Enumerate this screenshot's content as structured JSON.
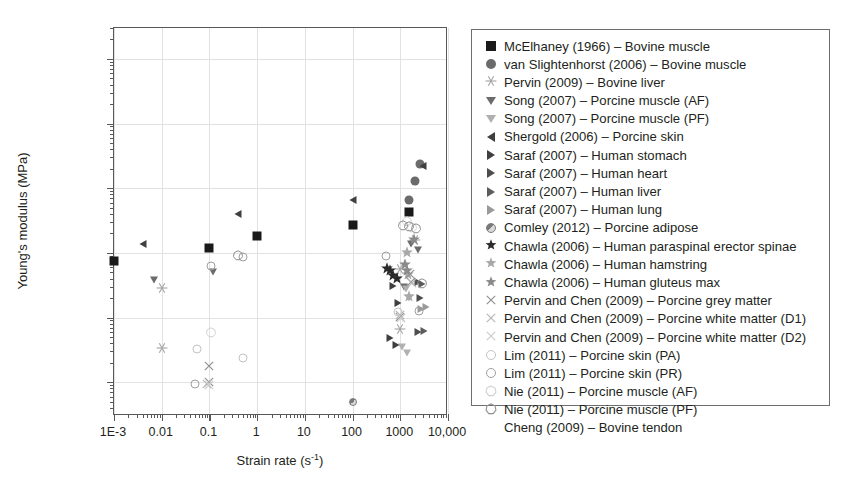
{
  "chart_data": {
    "type": "scatter",
    "title": "",
    "xlabel": "Strain rate (s-1)",
    "ylabel": "Young's modulus (MPa)",
    "xscale": "log",
    "yscale": "log",
    "xlim": [
      0.001,
      10000
    ],
    "ylim": [
      0.003,
      3000
    ],
    "grid": true,
    "legend_position": "right-outside",
    "xticklabels": [
      "1E-3",
      "0.01",
      "0.1",
      "1",
      "10",
      "100",
      "1000",
      "10,000"
    ],
    "xtickvalues": [
      0.001,
      0.01,
      0.1,
      1,
      10,
      100,
      1000,
      10000
    ],
    "yticklabels": [
      "0.01",
      "0.1",
      "1",
      "10",
      "100",
      "1000"
    ],
    "ytickvalues": [
      0.01,
      0.1,
      1,
      10,
      100,
      1000
    ],
    "series": [
      {
        "name": "McElhaney (1966) - Bovine muscle",
        "marker": "square-filled",
        "color": "#1a1a1a",
        "size": 9,
        "points": [
          [
            0.001,
            0.75
          ],
          [
            0.1,
            1.2
          ],
          [
            1,
            1.85
          ],
          [
            100,
            2.7
          ],
          [
            1500,
            4.3
          ]
        ]
      },
      {
        "name": "van Slightenhorst (2006) - Bovine muscle",
        "marker": "circle-filled",
        "color": "#6b6b6b",
        "size": 9,
        "points": [
          [
            1500,
            6.5
          ],
          [
            2000,
            13
          ],
          [
            2600,
            24
          ]
        ]
      },
      {
        "name": "Pervin (2009) - Bovine liver",
        "marker": "asterisk",
        "color": "#a6a6a6",
        "size": 10,
        "points": [
          [
            0.01,
            0.28
          ],
          [
            0.01,
            0.033
          ],
          [
            1000,
            0.55
          ],
          [
            1000,
            0.065
          ],
          [
            2000,
            1.5
          ]
        ]
      },
      {
        "name": "Song (2007) - Porcine muscle (AF)",
        "marker": "triangle-down",
        "color": "#6b6b6b",
        "size": 9,
        "points": [
          [
            0.007,
            0.38
          ],
          [
            0.12,
            0.5
          ],
          [
            1700,
            1.35
          ],
          [
            2400,
            1.1
          ],
          [
            1200,
            0.3
          ]
        ]
      },
      {
        "name": "Song (2007) - Porcine muscle (PF)",
        "marker": "triangle-down",
        "color": "#b0b0b0",
        "size": 9,
        "points": [
          [
            1300,
            0.28
          ],
          [
            1500,
            0.2
          ],
          [
            1100,
            0.035
          ],
          [
            1400,
            0.028
          ]
        ]
      },
      {
        "name": "Shergold (2006) - Porcine skin",
        "marker": "triangle-left",
        "color": "#3f3f3f",
        "size": 9,
        "points": [
          [
            0.004,
            1.35
          ],
          [
            0.4,
            4.0
          ],
          [
            100,
            6.5
          ],
          [
            3000,
            22
          ]
        ]
      },
      {
        "name": "Saraf (2007) - Human stomach",
        "marker": "triangle-right",
        "color": "#3f3f3f",
        "size": 9,
        "points": [
          [
            700,
            0.31
          ],
          [
            900,
            0.17
          ],
          [
            600,
            0.048
          ],
          [
            800,
            0.038
          ]
        ]
      },
      {
        "name": "Saraf (2007) - Human heart",
        "marker": "triangle-right",
        "color": "#4d4d4d",
        "size": 9,
        "points": [
          [
            2300,
            0.36
          ],
          [
            2600,
            0.2
          ],
          [
            2300,
            0.06
          ]
        ]
      },
      {
        "name": "Saraf (2007) - Human liver",
        "marker": "triangle-right",
        "color": "#5c5c5c",
        "size": 9,
        "points": [
          [
            2900,
            0.33
          ],
          [
            3200,
            0.062
          ]
        ]
      },
      {
        "name": "Saraf (2007) - Human lung",
        "marker": "triangle-right",
        "color": "#9a9a9a",
        "size": 9,
        "points": [
          [
            3400,
            0.145
          ],
          [
            2700,
            0.135
          ]
        ]
      },
      {
        "name": "Comley (2012) - Porcine adipose",
        "marker": "circle-half",
        "color": "#7a7a7a",
        "size": 8,
        "points": [
          [
            100,
            0.005
          ]
        ]
      },
      {
        "name": "Chawla (2006) - Human paraspinal erector spinae",
        "marker": "star",
        "color": "#2b2b2b",
        "size": 11,
        "points": [
          [
            520,
            0.55
          ],
          [
            620,
            0.5
          ],
          [
            720,
            0.42
          ],
          [
            850,
            0.38
          ]
        ]
      },
      {
        "name": "Chawla (2006) - Human hamstring",
        "marker": "star",
        "color": "#a8a8a8",
        "size": 11,
        "points": [
          [
            1400,
            0.95
          ],
          [
            1450,
            0.44
          ],
          [
            1500,
            0.2
          ]
        ]
      },
      {
        "name": "Chawla (2006) - Human gluteus max",
        "marker": "star",
        "color": "#8a8a8a",
        "size": 11,
        "points": [
          [
            1250,
            0.62
          ],
          [
            1900,
            1.55
          ],
          [
            1400,
            0.5
          ]
        ]
      },
      {
        "name": "Pervin and Chen (2009) - Porcine grey matter",
        "marker": "x-cross",
        "color": "#8f8f8f",
        "size": 10,
        "points": [
          [
            0.1,
            0.017
          ],
          [
            0.1,
            0.0098
          ],
          [
            1000,
            0.1
          ],
          [
            1600,
            0.45
          ],
          [
            1700,
            0.34
          ]
        ]
      },
      {
        "name": "Pervin and Chen (2009) - Porcine white matter (D1)",
        "marker": "x-cross",
        "color": "#b5b5b5",
        "size": 10,
        "points": [
          [
            0.09,
            0.0092
          ],
          [
            1000,
            0.105
          ],
          [
            1750,
            0.33
          ]
        ]
      },
      {
        "name": "Pervin and Chen (2009) - Porcine white matter (D2)",
        "marker": "x-cross",
        "color": "#cccccc",
        "size": 10,
        "points": [
          [
            0.1,
            0.0088
          ],
          [
            1050,
            0.095
          ]
        ]
      },
      {
        "name": "Lim (2011) - Porcine skin (PA)",
        "marker": "circle-open",
        "color": "#c2c2c2",
        "size": 9,
        "points": [
          [
            0.055,
            0.033
          ],
          [
            0.5,
            0.024
          ],
          [
            900,
            0.12
          ]
        ]
      },
      {
        "name": "Lim (2011) - Porcine skin (PR)",
        "marker": "circle-open",
        "color": "#9e9e9e",
        "size": 9,
        "points": [
          [
            0.05,
            0.0093
          ],
          [
            0.5,
            0.85
          ],
          [
            0.11,
            0.63
          ],
          [
            500,
            0.9
          ],
          [
            2500,
            0.125
          ]
        ]
      },
      {
        "name": "Nie (2011) - Porcine muscle (AF)",
        "marker": "heptagon-open",
        "color": "#d0d0d0",
        "size": 9,
        "points": [
          [
            0.11,
            0.058
          ],
          [
            1350,
            3.0
          ],
          [
            1800,
            2.4
          ]
        ]
      },
      {
        "name": "Nie (2011) - Porcine muscle (PF)",
        "marker": "heptagon-open",
        "color": "#8f8f8f",
        "size": 9,
        "points": [
          [
            0.4,
            0.9
          ],
          [
            1150,
            2.6
          ],
          [
            1550,
            2.5
          ],
          [
            2100,
            2.3
          ],
          [
            2900,
            0.33
          ]
        ]
      },
      {
        "name": "Cheng (2009) - Bovine tendon",
        "marker": "none",
        "color": "#ffffff",
        "size": 0,
        "points": []
      }
    ]
  },
  "axes": {
    "xlabel_main": "Strain rate (s",
    "xlabel_sup": "-1",
    "xlabel_tail": ")",
    "ylabel": "Young's modulus (MPa)"
  },
  "legend": {
    "items": [
      {
        "glyph": "square-filled",
        "color": "#1a1a1a",
        "label": "McElhaney (1966) – Bovine muscle"
      },
      {
        "glyph": "circle-filled",
        "color": "#6b6b6b",
        "label": "van Slightenhorst (2006) – Bovine muscle"
      },
      {
        "glyph": "asterisk",
        "color": "#a6a6a6",
        "label": "Pervin (2009) – Bovine liver"
      },
      {
        "glyph": "triangle-down",
        "color": "#6b6b6b",
        "label": "Song (2007) – Porcine muscle (AF)"
      },
      {
        "glyph": "triangle-down",
        "color": "#b0b0b0",
        "label": "Song (2007) – Porcine muscle (PF)"
      },
      {
        "glyph": "triangle-left",
        "color": "#3f3f3f",
        "label": "Shergold (2006) – Porcine skin"
      },
      {
        "glyph": "triangle-right",
        "color": "#3f3f3f",
        "label": "Saraf (2007) – Human stomach"
      },
      {
        "glyph": "triangle-right",
        "color": "#4d4d4d",
        "label": "Saraf (2007) – Human heart"
      },
      {
        "glyph": "triangle-right",
        "color": "#5c5c5c",
        "label": "Saraf (2007) – Human liver"
      },
      {
        "glyph": "triangle-right",
        "color": "#9a9a9a",
        "label": "Saraf (2007) – Human lung"
      },
      {
        "glyph": "circle-half",
        "color": "#7a7a7a",
        "label": "Comley (2012) – Porcine adipose"
      },
      {
        "glyph": "star",
        "color": "#2b2b2b",
        "label": "Chawla (2006) – Human paraspinal erector spinae"
      },
      {
        "glyph": "star",
        "color": "#a8a8a8",
        "label": "Chawla (2006) – Human hamstring"
      },
      {
        "glyph": "star",
        "color": "#8a8a8a",
        "label": "Chawla (2006) – Human gluteus max"
      },
      {
        "glyph": "x-cross",
        "color": "#8f8f8f",
        "label": "Pervin and Chen (2009) – Porcine grey matter"
      },
      {
        "glyph": "x-cross",
        "color": "#b5b5b5",
        "label": "Pervin and Chen (2009) – Porcine white matter (D1)"
      },
      {
        "glyph": "x-cross",
        "color": "#cccccc",
        "label": "Pervin and Chen (2009) – Porcine white matter (D2)"
      },
      {
        "glyph": "circle-open",
        "color": "#c2c2c2",
        "label": "Lim (2011) – Porcine skin (PA)"
      },
      {
        "glyph": "circle-open",
        "color": "#9e9e9e",
        "label": "Lim (2011) – Porcine skin (PR)"
      },
      {
        "glyph": "heptagon-open",
        "color": "#d0d0d0",
        "label": "Nie (2011) – Porcine muscle (AF)"
      },
      {
        "glyph": "heptagon-open",
        "color": "#8f8f8f",
        "label": "Nie (2011) – Porcine muscle (PF)"
      },
      {
        "glyph": "none",
        "color": "#ffffff",
        "label": "Cheng (2009) – Bovine tendon"
      }
    ]
  }
}
